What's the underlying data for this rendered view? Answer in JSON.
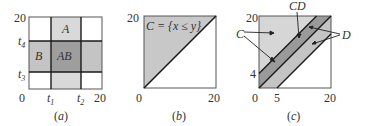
{
  "panels": [
    {
      "id": "a",
      "caption": "(a)",
      "axis": {
        "x_min": "0",
        "x_max": "20",
        "y_max": "20",
        "x_ticks": [
          "t1",
          "t2"
        ],
        "y_ticks": [
          "t3",
          "t4"
        ]
      },
      "regions": {
        "A": "A",
        "B": "B",
        "AB": "AB"
      },
      "tick_labels": {
        "t1": "t",
        "t1_sub": "1",
        "t2": "t",
        "t2_sub": "2",
        "t3": "t",
        "t3_sub": "3",
        "t4": "t",
        "t4_sub": "4"
      },
      "zero": "0",
      "twenty_x": "20",
      "twenty_y": "20"
    },
    {
      "id": "b",
      "caption": "(b)",
      "set_label": "C = {x ≤ y}",
      "zero": "0",
      "twenty_x": "20",
      "twenty_y": "20"
    },
    {
      "id": "c",
      "caption": "(c)",
      "labels": {
        "C": "C",
        "CD": "CD",
        "D": "D"
      },
      "zero": "0",
      "five": "5",
      "four": "4",
      "twenty_x": "20",
      "twenty_y": "20"
    }
  ],
  "colors": {
    "light_gray": "#d9d9d9",
    "mid_gray": "#bdbdbd",
    "dark_gray": "#9a9a9a",
    "line": "#1a1a1a"
  }
}
